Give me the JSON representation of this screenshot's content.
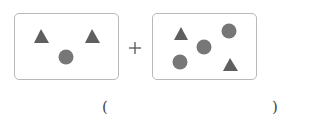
{
  "colors": {
    "triangle": "#5f5f5f",
    "circle": "#777777",
    "border": "#b9b9b9",
    "plus": "#555555"
  },
  "boxes": [
    {
      "label": "group-1",
      "triangles": 2,
      "circles": 1,
      "shapes": [
        {
          "type": "triangle",
          "x": 41,
          "y": 37
        },
        {
          "type": "triangle",
          "x": 92,
          "y": 37
        },
        {
          "type": "circle",
          "x": 66,
          "y": 57
        }
      ]
    },
    {
      "label": "group-2",
      "triangles": 2,
      "circles": 3,
      "shapes": [
        {
          "type": "triangle",
          "x": 181,
          "y": 35
        },
        {
          "type": "circle",
          "x": 229,
          "y": 31
        },
        {
          "type": "circle",
          "x": 204,
          "y": 47
        },
        {
          "type": "circle",
          "x": 180,
          "y": 62
        },
        {
          "type": "triangle",
          "x": 230,
          "y": 66
        }
      ]
    }
  ],
  "operator": "+",
  "answer": {
    "open_paren": "(",
    "close_paren": ")",
    "value": ""
  }
}
